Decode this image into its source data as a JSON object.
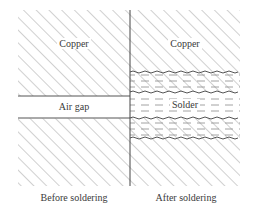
{
  "figure": {
    "panels": [
      {
        "id": "before",
        "caption": "Before soldering",
        "regions": [
          {
            "name": "top-copper",
            "label": "Copper",
            "fill": "diagonal-hatch"
          },
          {
            "name": "air-gap",
            "label": "Air gap",
            "fill": "blank"
          },
          {
            "name": "bottom-copper",
            "label": "",
            "fill": "diagonal-hatch"
          }
        ]
      },
      {
        "id": "after",
        "caption": "After soldering",
        "regions": [
          {
            "name": "top-copper",
            "label": "Copper",
            "fill": "diagonal-hatch"
          },
          {
            "name": "upper-intermetallic",
            "label": "",
            "fill": "hatch-with-dashes-wavy-borders"
          },
          {
            "name": "solder",
            "label": "Solder",
            "fill": "dashed-lines"
          },
          {
            "name": "lower-intermetallic",
            "label": "",
            "fill": "hatch-with-dashes-wavy-borders"
          },
          {
            "name": "bottom-copper",
            "label": "",
            "fill": "diagonal-hatch"
          }
        ]
      }
    ],
    "colors": {
      "line": "#555555",
      "hatch": "#8a8a8a",
      "text": "#3a3a3a",
      "background": "#ffffff"
    }
  }
}
